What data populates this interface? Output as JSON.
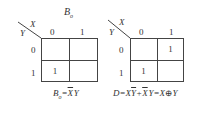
{
  "maps": [
    {
      "title_main": "B",
      "title_sub": "o",
      "col_var": "X",
      "row_var": "Y",
      "col_labels": [
        "0",
        "1"
      ],
      "row_labels": [
        "0",
        "1"
      ],
      "cells": [
        [
          "",
          ""
        ],
        [
          "1",
          ""
        ]
      ],
      "formula": {
        "lhs": "B",
        "lhs_sub": "o",
        "eq": "=",
        "term1_bar": "X",
        "term1_rest": "Y"
      }
    },
    {
      "title_main": "",
      "col_var": "X",
      "row_var": "Y",
      "col_labels": [
        "0",
        "1"
      ],
      "row_labels": [
        "0",
        "1"
      ],
      "cells": [
        [
          "",
          "1"
        ],
        [
          "1",
          ""
        ]
      ],
      "formula": {
        "lhs": "D",
        "eq": "=",
        "t1a": "X",
        "t1b_bar": "Y",
        "plus": "+",
        "t2a_bar": "X",
        "t2b": "Y",
        "eq2": "=",
        "x": "X",
        "xor": "⊕",
        "y": "Y"
      }
    }
  ]
}
